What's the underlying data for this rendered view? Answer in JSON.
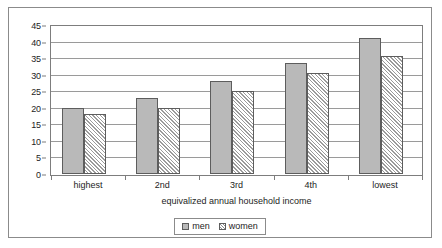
{
  "chart_data": {
    "type": "bar",
    "title": "",
    "subtitle": "",
    "xlabel": "equivalized annual household income",
    "ylabel": "",
    "categories": [
      "highest",
      "2nd",
      "3rd",
      "4th",
      "lowest"
    ],
    "series": [
      {
        "name": "men",
        "values": [
          20,
          23,
          28,
          33.5,
          41
        ]
      },
      {
        "name": "women",
        "values": [
          18,
          20,
          25,
          30.5,
          35.5
        ]
      }
    ],
    "ylim": [
      0,
      45
    ],
    "ytick_step": 5,
    "yticks": [
      0,
      5,
      10,
      15,
      20,
      25,
      30,
      35,
      40,
      45
    ],
    "grid": true,
    "grid_axis": "y",
    "legend": {
      "position": "bottom",
      "boxed": true
    },
    "colors": {
      "men_fill": "#b9b9b9",
      "women_fill": "#ffffff",
      "women_hatch": "#9b9b9b",
      "bar_outline": "#5d5d5d",
      "gridline": "#9a9a9a",
      "axis": "#7d7d7d",
      "frame": "#8b8b8b",
      "text": "#1d1d1d",
      "background": "#ffffff"
    }
  }
}
